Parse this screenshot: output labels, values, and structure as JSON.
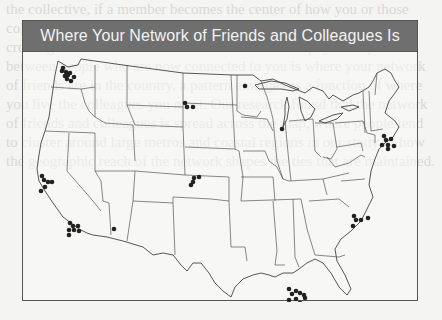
{
  "figure": {
    "title": "Where Your Network of Friends and Colleagues Is",
    "type": "dot-map",
    "region": "United States (contiguous)"
  },
  "background_text": "the collective, if a member becomes the center of how you or those colleagues and friends relate to connect through the social network, creating links where someone has access. Can the physical space between people who are now connected to you is where your network of friends are in the country, a pattern emerges as a function of where you live the colleagues you meet. Our research found that the network of friends and colleagues is spread across the map, where people tend to cluster around large metros and coastal regions in our study of how the geographic reach of the network shapes the ties that are maintained.",
  "colors": {
    "title_bar": "#6f6f6f",
    "title_text": "#f2f2f2",
    "outline": "#444444",
    "dot": "#222222",
    "page": "#f4f4f2"
  },
  "clusters": [
    {
      "name": "seattle",
      "dots": [
        [
          40,
          17
        ],
        [
          43,
          21
        ],
        [
          45,
          24
        ],
        [
          42,
          25
        ],
        [
          47,
          22
        ],
        [
          51,
          26
        ],
        [
          48,
          30
        ],
        [
          44,
          28
        ],
        [
          39,
          20
        ]
      ]
    },
    {
      "name": "sf-bay",
      "dots": [
        [
          19,
          125
        ],
        [
          21,
          129
        ],
        [
          25,
          131
        ],
        [
          29,
          131
        ],
        [
          22,
          136
        ],
        [
          18,
          140
        ]
      ]
    },
    {
      "name": "los-angeles",
      "dots": [
        [
          47,
          172
        ],
        [
          50,
          175
        ],
        [
          55,
          175
        ],
        [
          46,
          179
        ],
        [
          51,
          179
        ],
        [
          56,
          180
        ],
        [
          46,
          184
        ]
      ]
    },
    {
      "name": "phoenix",
      "dots": [
        [
          91,
          178
        ]
      ]
    },
    {
      "name": "south-dakota",
      "dots": [
        [
          162,
          52
        ],
        [
          164,
          56
        ],
        [
          170,
          56
        ]
      ]
    },
    {
      "name": "kansas",
      "dots": [
        [
          171,
          127
        ],
        [
          176,
          126
        ],
        [
          170,
          131
        ],
        [
          168,
          134
        ]
      ]
    },
    {
      "name": "minnesota",
      "dots": [
        [
          222,
          35
        ]
      ]
    },
    {
      "name": "chicago",
      "dots": [
        [
          259,
          78
        ]
      ]
    },
    {
      "name": "new-england",
      "dots": [
        [
          361,
          85
        ],
        [
          363,
          89
        ],
        [
          368,
          88
        ],
        [
          359,
          94
        ],
        [
          365,
          94
        ],
        [
          371,
          95
        ],
        [
          365,
          98
        ]
      ]
    },
    {
      "name": "north-carolina",
      "dots": [
        [
          331,
          165
        ],
        [
          333,
          169
        ],
        [
          338,
          169
        ],
        [
          345,
          167
        ],
        [
          330,
          175
        ]
      ]
    },
    {
      "name": "louisiana",
      "dots": [
        [
          266,
          238
        ],
        [
          269,
          243
        ],
        [
          273,
          240
        ],
        [
          277,
          242
        ],
        [
          281,
          244
        ],
        [
          266,
          249
        ],
        [
          273,
          248
        ],
        [
          277,
          252
        ],
        [
          282,
          247
        ]
      ]
    }
  ]
}
